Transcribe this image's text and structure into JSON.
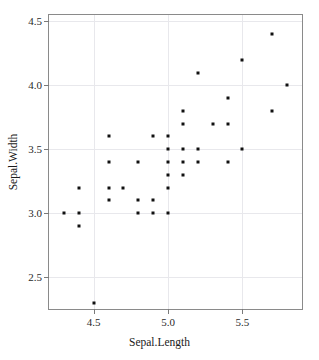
{
  "chart_data": {
    "type": "scatter",
    "title": "",
    "xlabel": "Sepal.Length",
    "ylabel": "Sepal.Width",
    "xlim": [
      4.2,
      5.9
    ],
    "ylim": [
      2.25,
      4.55
    ],
    "grid": true,
    "legend": null,
    "xticks": [
      4.5,
      5.0,
      5.5
    ],
    "xtick_labels": [
      "4.5",
      "5.0",
      "5.5"
    ],
    "yticks": [
      2.5,
      3.0,
      3.5,
      4.0,
      4.5
    ],
    "ytick_labels": [
      "2.5",
      "3.0",
      "3.5",
      "4.0",
      "4.5"
    ],
    "marker": "square",
    "marker_color": "#111111",
    "marker_size": 3,
    "points": [
      {
        "x": 4.3,
        "y": 3.0
      },
      {
        "x": 4.4,
        "y": 3.2
      },
      {
        "x": 4.4,
        "y": 3.0
      },
      {
        "x": 4.4,
        "y": 2.9
      },
      {
        "x": 4.5,
        "y": 2.3
      },
      {
        "x": 4.6,
        "y": 3.6
      },
      {
        "x": 4.6,
        "y": 3.4
      },
      {
        "x": 4.6,
        "y": 3.1
      },
      {
        "x": 4.6,
        "y": 3.2
      },
      {
        "x": 4.7,
        "y": 3.2
      },
      {
        "x": 4.8,
        "y": 3.4
      },
      {
        "x": 4.8,
        "y": 3.1
      },
      {
        "x": 4.8,
        "y": 3.0
      },
      {
        "x": 4.9,
        "y": 3.6
      },
      {
        "x": 4.9,
        "y": 3.1
      },
      {
        "x": 4.9,
        "y": 3.0
      },
      {
        "x": 5.0,
        "y": 3.6
      },
      {
        "x": 5.0,
        "y": 3.5
      },
      {
        "x": 5.0,
        "y": 3.4
      },
      {
        "x": 5.0,
        "y": 3.3
      },
      {
        "x": 5.0,
        "y": 3.2
      },
      {
        "x": 5.0,
        "y": 3.0
      },
      {
        "x": 5.1,
        "y": 3.8
      },
      {
        "x": 5.1,
        "y": 3.5
      },
      {
        "x": 5.1,
        "y": 3.4
      },
      {
        "x": 5.1,
        "y": 3.3
      },
      {
        "x": 5.1,
        "y": 3.7
      },
      {
        "x": 5.2,
        "y": 4.1
      },
      {
        "x": 5.2,
        "y": 3.5
      },
      {
        "x": 5.2,
        "y": 3.4
      },
      {
        "x": 5.3,
        "y": 3.7
      },
      {
        "x": 5.4,
        "y": 3.9
      },
      {
        "x": 5.4,
        "y": 3.7
      },
      {
        "x": 5.4,
        "y": 3.4
      },
      {
        "x": 5.5,
        "y": 4.2
      },
      {
        "x": 5.5,
        "y": 3.5
      },
      {
        "x": 5.7,
        "y": 4.4
      },
      {
        "x": 5.7,
        "y": 3.8
      },
      {
        "x": 5.8,
        "y": 4.0
      }
    ]
  }
}
